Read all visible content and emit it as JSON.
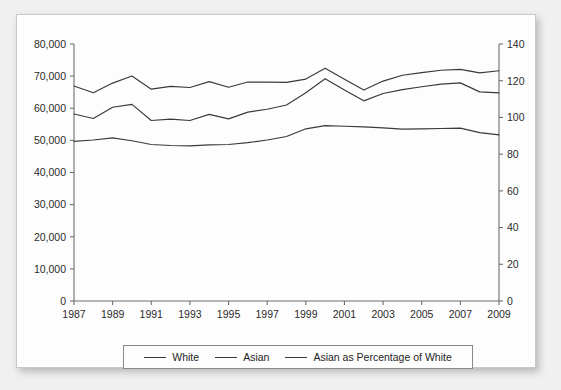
{
  "chart_data": {
    "type": "line",
    "title": "",
    "xlabel": "",
    "ylabel": "",
    "y2label": "",
    "grid": false,
    "legend_position": "bottom",
    "x": [
      1987,
      1988,
      1989,
      1990,
      1991,
      1992,
      1993,
      1994,
      1995,
      1996,
      1997,
      1998,
      1999,
      2000,
      2001,
      2002,
      2003,
      2004,
      2005,
      2006,
      2007,
      2008,
      2009
    ],
    "xtick_labels": [
      "1987",
      "1989",
      "1991",
      "1993",
      "1995",
      "1997",
      "1999",
      "2001",
      "2003",
      "2005",
      "2007",
      "2009"
    ],
    "xlim": [
      1987,
      2009
    ],
    "ylim": [
      0,
      80000
    ],
    "ytick_labels": [
      "0",
      "10,000",
      "20,000",
      "30,000",
      "40,000",
      "50,000",
      "60,000",
      "70,000",
      "80,000"
    ],
    "ytick_values": [
      0,
      10000,
      20000,
      30000,
      40000,
      50000,
      60000,
      70000,
      80000
    ],
    "y2lim": [
      0,
      140
    ],
    "y2tick_labels": [
      "0",
      "20",
      "40",
      "60",
      "80",
      "100",
      "120",
      "140"
    ],
    "y2tick_values": [
      0,
      20,
      40,
      60,
      80,
      100,
      120,
      140
    ],
    "series": [
      {
        "name": "White",
        "axis": "left",
        "values": [
          49700,
          50100,
          50800,
          49900,
          48700,
          48400,
          48300,
          48600,
          48700,
          49300,
          50100,
          51200,
          53600,
          54600,
          54400,
          54200,
          53900,
          53500,
          53600,
          53700,
          53800,
          52400,
          51700
        ]
      },
      {
        "name": "Asian",
        "axis": "left",
        "values": [
          58200,
          56800,
          60300,
          61200,
          56200,
          56600,
          56200,
          58100,
          56700,
          58800,
          59700,
          61000,
          64800,
          69200,
          65700,
          62300,
          64600,
          65800,
          66700,
          67500,
          67900,
          65100,
          64800
        ]
      },
      {
        "name": "Asian as Percentage of White",
        "axis": "right",
        "values": [
          117.1,
          113.4,
          118.7,
          122.6,
          115.4,
          116.9,
          116.3,
          119.5,
          116.4,
          119.3,
          119.2,
          119.1,
          120.9,
          126.8,
          120.8,
          114.9,
          119.8,
          123.0,
          124.4,
          125.7,
          126.2,
          124.3,
          125.4
        ]
      }
    ]
  },
  "legend": {
    "entries": [
      {
        "label": "White",
        "swatch": "line-swatch"
      },
      {
        "label": "Asian",
        "swatch": "line-swatch"
      },
      {
        "label": "Asian as Percentage of White",
        "swatch": "line-swatch"
      }
    ]
  },
  "colors": {
    "line": "#3a3a3a",
    "axis": "#6e6e6e",
    "text": "#1f1f1f",
    "card_background": "#fdfdfd",
    "page_background": "#f0f0f0",
    "card_border": "#c8c8c8"
  }
}
